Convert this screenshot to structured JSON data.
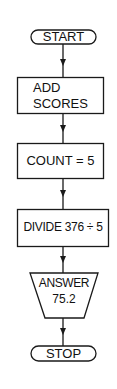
{
  "flowchart": {
    "colors": {
      "stroke": "#1a1a1a",
      "background": "#ffffff",
      "text": "#111111"
    },
    "nodes": [
      {
        "id": "start",
        "shape": "terminator",
        "label": "START"
      },
      {
        "id": "add",
        "shape": "process",
        "line1": "ADD",
        "line2": "SCORES"
      },
      {
        "id": "count",
        "shape": "process",
        "label": "COUNT = 5"
      },
      {
        "id": "divide",
        "shape": "process",
        "label": "DIVIDE 376 ÷ 5"
      },
      {
        "id": "answer",
        "shape": "output",
        "line1": "ANSWER",
        "line2": "75.2"
      },
      {
        "id": "stop",
        "shape": "terminator",
        "label": "STOP"
      }
    ],
    "edges": [
      {
        "from": "start",
        "to": "add"
      },
      {
        "from": "add",
        "to": "count"
      },
      {
        "from": "count",
        "to": "divide"
      },
      {
        "from": "divide",
        "to": "answer"
      },
      {
        "from": "answer",
        "to": "stop"
      }
    ]
  }
}
